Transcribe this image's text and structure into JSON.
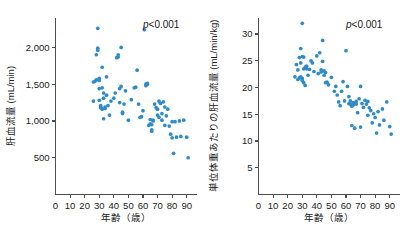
{
  "figure": {
    "accent_color": "#2e8bc8",
    "axis_color": "#4d4d4d",
    "background": "#ffffff"
  },
  "panels": [
    {
      "id": "left",
      "pvalue_p": "p",
      "pvalue_rest": "<0.001"
    },
    {
      "id": "right",
      "pvalue_p": "p",
      "pvalue_rest": "<0.001"
    }
  ],
  "chart_data": [
    {
      "type": "scatter",
      "title": "",
      "xlabel": "年齢（歳）",
      "ylabel": "肝血流量 (mL/min)",
      "xlim": [
        0,
        95
      ],
      "ylim": [
        0,
        2400
      ],
      "xticks": [
        0,
        10,
        20,
        30,
        40,
        50,
        60,
        70,
        80,
        90
      ],
      "xticklabels": [
        "0",
        "10",
        "20",
        "30",
        "40",
        "50",
        "60",
        "70",
        "80",
        "90"
      ],
      "yticks": [
        500,
        1000,
        1500,
        2000
      ],
      "yticklabels": [
        "500",
        "1,000",
        "1,500",
        "2,000"
      ],
      "grid": false,
      "legend": null,
      "annotations": [
        {
          "text": "p<0.001",
          "x": 70,
          "y": 2300
        }
      ],
      "points": [
        [
          26,
          1270
        ],
        [
          26,
          1530
        ],
        [
          27,
          1540
        ],
        [
          28,
          1560
        ],
        [
          28,
          1900
        ],
        [
          29,
          1960
        ],
        [
          29,
          1990
        ],
        [
          29,
          2260
        ],
        [
          30,
          1550
        ],
        [
          30,
          1580
        ],
        [
          30,
          1440
        ],
        [
          30,
          1280
        ],
        [
          31,
          1180
        ],
        [
          31,
          1190
        ],
        [
          31,
          1210
        ],
        [
          32,
          1160
        ],
        [
          32,
          1450
        ],
        [
          32,
          1730
        ],
        [
          33,
          1380
        ],
        [
          33,
          1310
        ],
        [
          33,
          1030
        ],
        [
          34,
          1170
        ],
        [
          34,
          1190
        ],
        [
          35,
          1600
        ],
        [
          35,
          1350
        ],
        [
          36,
          1210
        ],
        [
          37,
          1080
        ],
        [
          38,
          1270
        ],
        [
          40,
          1310
        ],
        [
          41,
          1380
        ],
        [
          42,
          1860
        ],
        [
          43,
          1900
        ],
        [
          43,
          1870
        ],
        [
          44,
          1250
        ],
        [
          44,
          1440
        ],
        [
          45,
          2000
        ],
        [
          45,
          1470
        ],
        [
          46,
          1100
        ],
        [
          46,
          1120
        ],
        [
          47,
          1230
        ],
        [
          48,
          1410
        ],
        [
          50,
          1010
        ],
        [
          52,
          1290
        ],
        [
          54,
          1450
        ],
        [
          55,
          1460
        ],
        [
          56,
          1690
        ],
        [
          57,
          1230
        ],
        [
          58,
          1050
        ],
        [
          59,
          1060
        ],
        [
          60,
          1140
        ],
        [
          61,
          2240
        ],
        [
          62,
          1500
        ],
        [
          62,
          1480
        ],
        [
          63,
          1500
        ],
        [
          63,
          1510
        ],
        [
          64,
          940
        ],
        [
          65,
          1020
        ],
        [
          65,
          960
        ],
        [
          66,
          880
        ],
        [
          66,
          860
        ],
        [
          66,
          950
        ],
        [
          67,
          1000
        ],
        [
          67,
          1010
        ],
        [
          68,
          1230
        ],
        [
          69,
          1180
        ],
        [
          70,
          1160
        ],
        [
          70,
          1080
        ],
        [
          71,
          1050
        ],
        [
          71,
          1270
        ],
        [
          72,
          1240
        ],
        [
          73,
          1100
        ],
        [
          73,
          1010
        ],
        [
          74,
          1260
        ],
        [
          75,
          1190
        ],
        [
          75,
          940
        ],
        [
          76,
          1070
        ],
        [
          77,
          1160
        ],
        [
          78,
          930
        ],
        [
          79,
          820
        ],
        [
          80,
          770
        ],
        [
          80,
          990
        ],
        [
          81,
          560
        ],
        [
          82,
          990
        ],
        [
          83,
          780
        ],
        [
          85,
          1000
        ],
        [
          86,
          790
        ],
        [
          88,
          1010
        ],
        [
          90,
          780
        ],
        [
          91,
          500
        ]
      ]
    },
    {
      "type": "scatter",
      "title": "",
      "xlabel": "年齢（歳）",
      "ylabel": "単位体重あたりの肝血流量 (mL/min/kg)",
      "xlim": [
        0,
        95
      ],
      "ylim": [
        0,
        33
      ],
      "xticks": [
        0,
        10,
        20,
        30,
        40,
        50,
        60,
        70,
        80,
        90
      ],
      "xticklabels": [
        "0",
        "10",
        "20",
        "30",
        "40",
        "50",
        "60",
        "70",
        "80",
        "90"
      ],
      "yticks": [
        5,
        10,
        15,
        20,
        25,
        30
      ],
      "yticklabels": [
        "5",
        "10",
        "15",
        "20",
        "25",
        "30"
      ],
      "grid": false,
      "legend": null,
      "annotations": [
        {
          "text": "p<0.001",
          "x": 70,
          "y": 31.2
        }
      ],
      "points": [
        [
          25,
          22.0
        ],
        [
          26,
          24.3
        ],
        [
          27,
          21.5
        ],
        [
          27,
          23.3
        ],
        [
          28,
          21.8
        ],
        [
          28,
          25.6
        ],
        [
          29,
          27.3
        ],
        [
          29,
          24.6
        ],
        [
          29,
          22.0
        ],
        [
          30,
          25.8
        ],
        [
          30,
          21.7
        ],
        [
          30,
          21.3
        ],
        [
          30,
          32.0
        ],
        [
          31,
          23.5
        ],
        [
          31,
          20.9
        ],
        [
          31,
          25.7
        ],
        [
          32,
          23.8
        ],
        [
          32,
          20.4
        ],
        [
          33,
          24.0
        ],
        [
          33,
          23.5
        ],
        [
          34,
          22.3
        ],
        [
          35,
          23.4
        ],
        [
          36,
          25.0
        ],
        [
          37,
          24.6
        ],
        [
          38,
          23.0
        ],
        [
          40,
          25.9
        ],
        [
          41,
          22.6
        ],
        [
          42,
          26.5
        ],
        [
          43,
          23.3
        ],
        [
          43,
          22.9
        ],
        [
          44,
          28.8
        ],
        [
          44,
          24.9
        ],
        [
          45,
          22.3
        ],
        [
          45,
          23.1
        ],
        [
          46,
          22.8
        ],
        [
          46,
          20.9
        ],
        [
          47,
          21.0
        ],
        [
          48,
          20.5
        ],
        [
          50,
          21.9
        ],
        [
          52,
          19.3
        ],
        [
          53,
          20.2
        ],
        [
          54,
          18.6
        ],
        [
          55,
          17.3
        ],
        [
          56,
          16.6
        ],
        [
          57,
          19.3
        ],
        [
          58,
          21.1
        ],
        [
          59,
          17.5
        ],
        [
          60,
          26.9
        ],
        [
          61,
          20.2
        ],
        [
          62,
          18.3
        ],
        [
          62,
          17.0
        ],
        [
          63,
          16.9
        ],
        [
          63,
          17.5
        ],
        [
          64,
          16.5
        ],
        [
          64,
          12.9
        ],
        [
          65,
          17.2
        ],
        [
          65,
          16.8
        ],
        [
          66,
          12.4
        ],
        [
          67,
          17.4
        ],
        [
          67,
          16.9
        ],
        [
          68,
          15.3
        ],
        [
          69,
          17.9
        ],
        [
          70,
          20.2
        ],
        [
          70,
          12.6
        ],
        [
          71,
          17.0
        ],
        [
          72,
          16.3
        ],
        [
          73,
          17.6
        ],
        [
          74,
          16.9
        ],
        [
          75,
          17.4
        ],
        [
          75,
          14.8
        ],
        [
          76,
          16.2
        ],
        [
          77,
          15.7
        ],
        [
          78,
          13.4
        ],
        [
          79,
          15.1
        ],
        [
          80,
          14.4
        ],
        [
          81,
          11.5
        ],
        [
          82,
          15.5
        ],
        [
          83,
          13.0
        ],
        [
          85,
          16.0
        ],
        [
          86,
          13.9
        ],
        [
          88,
          17.3
        ],
        [
          90,
          12.7
        ],
        [
          91,
          11.3
        ]
      ]
    }
  ]
}
